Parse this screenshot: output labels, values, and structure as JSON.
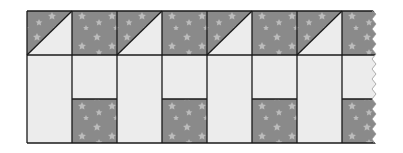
{
  "diagram": {
    "title": "",
    "colors": {
      "print_fabric": "#8a8a8a",
      "print_star": "#c9c9c9",
      "light_fabric": "#ececec",
      "seam_line": "#1a1a1a",
      "background": "#ffffff"
    },
    "grid": {
      "left": 27,
      "top": 11,
      "column_width": 45,
      "top_row_height": 44,
      "bottom_section_height": 88,
      "mid_split_y": 99,
      "bottom_y": 143,
      "columns": 8,
      "right_edge": "torn"
    },
    "columns": [
      {
        "index": 0,
        "top": "half-square-triangle",
        "bottom": "tall-light"
      },
      {
        "index": 1,
        "top": "print-square",
        "bottom": "light-over-print"
      },
      {
        "index": 2,
        "top": "half-square-triangle",
        "bottom": "tall-light"
      },
      {
        "index": 3,
        "top": "print-square",
        "bottom": "light-over-print"
      },
      {
        "index": 4,
        "top": "half-square-triangle",
        "bottom": "tall-light"
      },
      {
        "index": 5,
        "top": "print-square",
        "bottom": "light-over-print"
      },
      {
        "index": 6,
        "top": "half-square-triangle",
        "bottom": "tall-light"
      },
      {
        "index": 7,
        "top": "print-square",
        "bottom": "light-over-print"
      }
    ]
  }
}
